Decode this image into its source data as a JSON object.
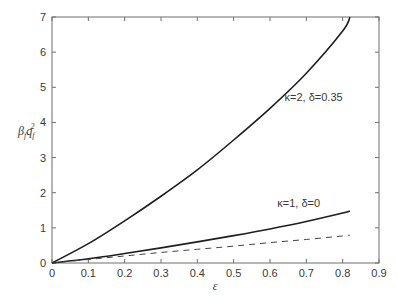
{
  "chart_data": {
    "type": "line",
    "title": "",
    "xlabel": "ε",
    "ylabel": "β_f q_f²",
    "xlim": [
      0,
      0.9
    ],
    "ylim": [
      0,
      7
    ],
    "xticks": [
      0,
      0.1,
      0.2,
      0.3,
      0.4,
      0.5,
      0.6,
      0.7,
      0.8,
      0.9
    ],
    "xtick_labels": [
      "0",
      "0.1",
      "0.2",
      "0.3",
      "0.4",
      "0.5",
      "0.6",
      "0.7",
      "0.8",
      "0.9"
    ],
    "yticks": [
      0,
      1,
      2,
      3,
      4,
      5,
      6,
      7
    ],
    "ytick_labels": [
      "0",
      "1",
      "2",
      "3",
      "4",
      "5",
      "6",
      "7"
    ],
    "grid": false,
    "legend": null,
    "series": [
      {
        "name": "κ=2, δ=0.35",
        "style": "solid",
        "x": [
          0,
          0.1,
          0.2,
          0.3,
          0.4,
          0.5,
          0.6,
          0.7,
          0.8,
          0.82
        ],
        "y": [
          0,
          0.55,
          1.2,
          1.9,
          2.65,
          3.5,
          4.4,
          5.4,
          6.6,
          7.0
        ]
      },
      {
        "name": "κ=1, δ=0",
        "style": "solid",
        "x": [
          0,
          0.1,
          0.2,
          0.3,
          0.4,
          0.5,
          0.6,
          0.7,
          0.8,
          0.82
        ],
        "y": [
          0,
          0.12,
          0.27,
          0.43,
          0.6,
          0.78,
          0.97,
          1.18,
          1.42,
          1.48
        ]
      },
      {
        "name": "reference (dashed)",
        "style": "dashed",
        "x": [
          0,
          0.1,
          0.2,
          0.3,
          0.4,
          0.5,
          0.6,
          0.7,
          0.8,
          0.82
        ],
        "y": [
          0,
          0.1,
          0.2,
          0.3,
          0.39,
          0.48,
          0.58,
          0.67,
          0.77,
          0.79
        ]
      }
    ],
    "annotations": [
      {
        "text": "κ=2, δ=0.35",
        "x": 0.64,
        "y": 4.6
      },
      {
        "text": "κ=1, δ=0",
        "x": 0.62,
        "y": 1.6
      }
    ]
  }
}
